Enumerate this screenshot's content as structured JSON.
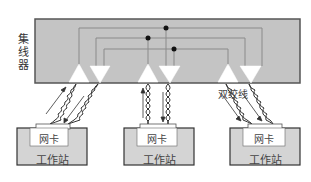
{
  "diagram": {
    "hub": {
      "label": "集线器",
      "fill": "#c4c4c4",
      "border": "#555555"
    },
    "cable_label": "双绞线",
    "workstations": [
      {
        "nic_label": "网卡",
        "label": "工作站"
      },
      {
        "nic_label": "网卡",
        "label": "工作站"
      },
      {
        "nic_label": "网卡",
        "label": "工作站"
      }
    ],
    "colors": {
      "line": "#8a8a8a",
      "dot": "#111111",
      "triangle": "#ffffff",
      "ws_fill": "#d4d4d4",
      "nic_fill": "#ffffff"
    }
  }
}
